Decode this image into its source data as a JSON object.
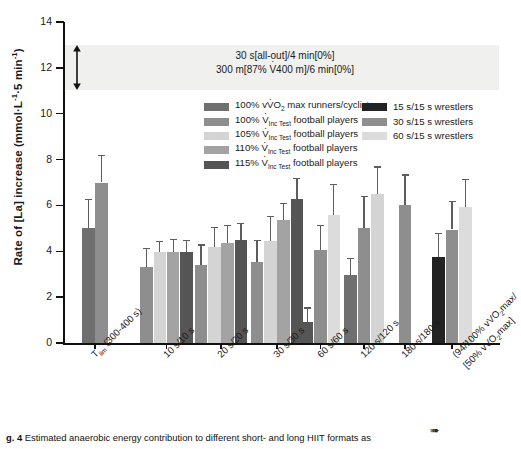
{
  "chart_data": {
    "type": "bar",
    "title": "",
    "xlabel": "",
    "ylabel": "Rate of [La] increase (mmol·L⁻¹·5 min⁻¹)",
    "ylim": [
      0,
      14
    ],
    "ytick_values": [
      0,
      2,
      4,
      6,
      8,
      10,
      12,
      14
    ],
    "ytick_labels": [
      "0",
      "2",
      "4",
      "6",
      "8",
      "10",
      "12",
      "14"
    ],
    "grid": false,
    "legend_position": "upper-center",
    "categories": [
      "T_lim (300-400 s)",
      "10 s/10 s",
      "20 s/20 s",
      "30 s/30 s",
      "60 s/60 s",
      "120 s/120 s",
      "180 s/180 s",
      "(94/100% vVO2max/[50% vVO2max]"
    ],
    "series": [
      {
        "name": "100% vVO2 max runners/cyclists",
        "color": "#6f6f6f",
        "values": [
          5.0,
          null,
          null,
          null,
          null,
          2.95,
          null,
          null
        ],
        "errors": [
          1.3,
          null,
          null,
          null,
          null,
          0.75,
          null,
          null
        ]
      },
      {
        "name": "100% VIncTest football players",
        "color": "#8e8e8e",
        "values": [
          7.0,
          3.3,
          3.4,
          3.55,
          null,
          5.0,
          6.0,
          null
        ],
        "errors": [
          1.2,
          0.85,
          0.9,
          0.95,
          null,
          1.4,
          1.35,
          null
        ]
      },
      {
        "name": "105% VIncTest football players",
        "color": "#d4d4d4",
        "values": [
          null,
          3.95,
          4.2,
          4.45,
          null,
          6.5,
          null,
          null
        ],
        "errors": [
          null,
          0.5,
          0.85,
          1.1,
          null,
          1.2,
          null,
          null
        ]
      },
      {
        "name": "110% VIncTest football players",
        "color": "#a3a3a3",
        "values": [
          null,
          3.95,
          4.35,
          5.35,
          null,
          null,
          null,
          null
        ],
        "errors": [
          null,
          0.6,
          0.8,
          0.75,
          null,
          null,
          null,
          null
        ]
      },
      {
        "name": "115% VIncTest football players",
        "color": "#555555",
        "values": [
          null,
          3.95,
          4.5,
          6.3,
          0.9,
          null,
          null,
          null
        ],
        "errors": [
          null,
          0.55,
          0.75,
          0.9,
          0.65,
          null,
          null,
          null
        ]
      },
      {
        "name": "15 s/15 s wrestlers",
        "color": "#222222",
        "values": [
          null,
          null,
          null,
          null,
          null,
          null,
          null,
          3.75
        ],
        "errors": [
          null,
          null,
          null,
          null,
          null,
          null,
          null,
          1.05
        ]
      },
      {
        "name": "30 s/15 s wrestlers",
        "color": "#8e8e8e",
        "values": [
          null,
          null,
          null,
          null,
          4.05,
          null,
          null,
          4.95
        ],
        "errors": [
          null,
          null,
          null,
          null,
          1.1,
          null,
          null,
          1.25
        ]
      },
      {
        "name": "60 s/15 s wrestlers",
        "color": "#dcdcdc",
        "values": [
          null,
          null,
          null,
          null,
          5.6,
          null,
          null,
          5.95
        ],
        "errors": [
          null,
          null,
          null,
          null,
          1.35,
          null,
          null,
          1.2
        ]
      }
    ],
    "annotation_band": {
      "y_range": [
        11.0,
        13.0
      ],
      "line1": "30 s[all-out]/4 min[0%]",
      "line2": "300 m[87% V400 m]/6 min[0%]"
    }
  },
  "axis": {
    "y_title_main": "Rate of [La] increase (mmol·L",
    "y_title_sup1": "-1",
    "y_title_mid": "·5 min",
    "y_title_sup2": "-1",
    "y_title_end": ")",
    "ticks": [
      "14",
      "12",
      "10",
      "8",
      "6",
      "4",
      "2",
      "0"
    ]
  },
  "xlabels": [
    {
      "main": "T",
      "sub": "lim",
      "tail": " (300-400 s)"
    },
    {
      "main": "10 s/10 s",
      "sub": "",
      "tail": ""
    },
    {
      "main": "20 s/20 s",
      "sub": "",
      "tail": ""
    },
    {
      "main": "30 s/30 s",
      "sub": "",
      "tail": ""
    },
    {
      "main": "60 s/60 s",
      "sub": "",
      "tail": ""
    },
    {
      "main": "120 s/120 s",
      "sub": "",
      "tail": ""
    },
    {
      "main": "180 s/180 s",
      "sub": "",
      "tail": ""
    },
    {
      "main": "(94/100% vVO",
      "sub": "2",
      "tail": "max/"
    }
  ],
  "xlabel_last_line2": {
    "main": "[50% vVO",
    "sub": "2",
    "tail": "max]"
  },
  "legend": {
    "left": [
      {
        "pre": "100% v",
        "dotted": "V",
        "sub": "",
        "post": "O",
        "sub2": "2",
        "post2": " max runners/cyclists",
        "color": "#6f6f6f",
        "kind": "vo2"
      },
      {
        "pre": "100% ",
        "dotted": "V",
        "sub": "Inc Test",
        "post": " football players",
        "color": "#8e8e8e",
        "kind": "vinc"
      },
      {
        "pre": "105% ",
        "dotted": "V",
        "sub": "Inc Test",
        "post": " football players",
        "color": "#d4d4d4",
        "kind": "vinc"
      },
      {
        "pre": "110% ",
        "dotted": "V",
        "sub": "Inc Test",
        "post": " football players",
        "color": "#a3a3a3",
        "kind": "vinc"
      },
      {
        "pre": "115% ",
        "dotted": "V",
        "sub": "Inc Test",
        "post": " football players",
        "color": "#555555",
        "kind": "vinc"
      }
    ],
    "right": [
      {
        "label": "15 s/15 s wrestlers",
        "color": "#222222"
      },
      {
        "label": "30 s/15 s wrestlers",
        "color": "#8e8e8e"
      },
      {
        "label": "60 s/15 s wrestlers",
        "color": "#dcdcdc"
      }
    ]
  },
  "annotation": {
    "line1": "30 s[all-out]/4 min[0%]",
    "line2_a": "300 m[87% ",
    "line2_v": "V",
    "line2_b": "400 m]/6 min[0%]"
  },
  "caption": {
    "number": "g. 4",
    "text": "Estimated anaerobic energy contribution to different short- and long HIIT formats as"
  },
  "colors": {
    "band": "#f0f0ef",
    "axis": "#111111",
    "error": "#5d5d5d"
  }
}
